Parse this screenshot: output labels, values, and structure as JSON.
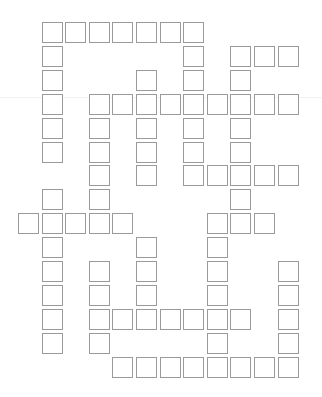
{
  "puzzle": {
    "type": "crossword-grid",
    "cols": 12,
    "rows": 15,
    "origin_x": 18,
    "origin_y": 22,
    "pitch_x": 23.6,
    "pitch_y": 23.9,
    "border_color": "#9a9a9a",
    "background": "#ffffff",
    "cells_by_row": [
      [
        1,
        2,
        3,
        4,
        5,
        6,
        7
      ],
      [
        1,
        7,
        9,
        10,
        11
      ],
      [
        1,
        5,
        7,
        9
      ],
      [
        1,
        3,
        4,
        5,
        6,
        7,
        8,
        9,
        10,
        11
      ],
      [
        1,
        3,
        5,
        7,
        9
      ],
      [
        1,
        3,
        5,
        7,
        9
      ],
      [
        3,
        5,
        7,
        8,
        9,
        10,
        11
      ],
      [
        1,
        3,
        9
      ],
      [
        0,
        1,
        2,
        3,
        4,
        8,
        9,
        10
      ],
      [
        1,
        5,
        8
      ],
      [
        1,
        3,
        5,
        8,
        11
      ],
      [
        1,
        3,
        5,
        8,
        11
      ],
      [
        1,
        3,
        4,
        5,
        6,
        7,
        8,
        9,
        11
      ],
      [
        1,
        3,
        8,
        11
      ],
      [
        4,
        5,
        6,
        7,
        8,
        9,
        10,
        11
      ]
    ]
  }
}
